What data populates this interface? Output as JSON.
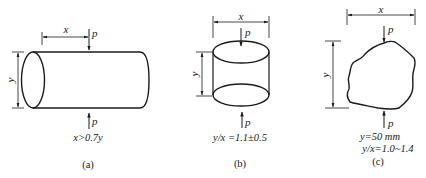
{
  "figure": {
    "panels": [
      {
        "id": "a",
        "caption": "(a)",
        "shape": "horizontal cylinder",
        "dim_x_label": "x",
        "dim_y_label": "y",
        "load_top_label": "p",
        "load_bottom_label": "p",
        "condition": "x>0.7y"
      },
      {
        "id": "b",
        "caption": "(b)",
        "shape": "vertical cylinder",
        "dim_x_label": "x",
        "dim_y_label": "y",
        "load_top_label": "p",
        "load_bottom_label": "p",
        "condition": "y/x =1.1±0.5"
      },
      {
        "id": "c",
        "caption": "(c)",
        "shape": "irregular lump",
        "dim_x_label": "x",
        "dim_y_label": "y",
        "load_top_label": "p",
        "load_bottom_label": "p",
        "condition_line1": "y=50 mm",
        "condition_line2": "y/x=1.0~1.4"
      }
    ]
  },
  "colors": {
    "stroke": "#1a1a1a",
    "background": "#ffffff"
  }
}
